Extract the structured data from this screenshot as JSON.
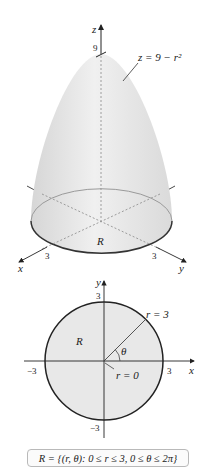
{
  "figure3d": {
    "z_axis_label": "z",
    "z_tick_label": "9",
    "surface_label": "z = 9 − r²",
    "region_label": "R",
    "x_axis_label": "x",
    "y_axis_label": "y",
    "x_tick_label": "3",
    "y_tick_label": "3",
    "colors": {
      "surface": "#e6e6e6",
      "outline": "#333333",
      "dashed": "#888888"
    }
  },
  "figure2d": {
    "x_axis_label": "x",
    "y_axis_label": "y",
    "x_pos_tick": "3",
    "x_neg_tick": "−3",
    "y_pos_tick": "3",
    "y_neg_tick": "−3",
    "region_label": "R",
    "radius_label": "r = 3",
    "origin_label": "r = 0",
    "angle_label": "θ",
    "colors": {
      "fill": "#e8e8e8",
      "circle": "#222222"
    }
  },
  "caption": {
    "text": "R = {(r, θ): 0 ≤ r ≤ 3, 0 ≤ θ ≤ 2π}"
  }
}
